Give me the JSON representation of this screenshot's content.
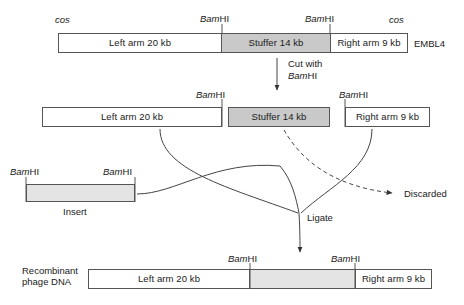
{
  "diagram": {
    "enzyme": {
      "italic_part": "Bam",
      "roman_part": "HI",
      "full": "BamHI"
    },
    "colors": {
      "stuffer_fill": "#c9c9c9",
      "insert_fill": "#e4e4e4",
      "arm_fill": "#ffffff",
      "outline": "#555555",
      "line": "#444444"
    }
  },
  "row_vector": {
    "vector_name": "EMBL4",
    "cos_left": "cos",
    "cos_right": "cos",
    "sites": [
      "BamHI",
      "BamHI"
    ],
    "segments": [
      {
        "label": "Left arm 20 kb",
        "fill": "white"
      },
      {
        "label": "Stuffer 14 kb",
        "fill": "gray"
      },
      {
        "label": "Right arm 9 kb",
        "fill": "white"
      }
    ]
  },
  "step_cut": {
    "line1": "Cut with",
    "line2": "BamHI"
  },
  "row_cut": {
    "sites": [
      "BamHI",
      "BamHI"
    ],
    "segments": [
      {
        "label": "Left arm 20 kb",
        "fill": "white"
      },
      {
        "label": "Stuffer 14 kb",
        "fill": "gray"
      },
      {
        "label": "Right arm 9 kb",
        "fill": "white"
      }
    ]
  },
  "row_insert": {
    "caption": "Insert",
    "sites": [
      "BamHI",
      "BamHI"
    ]
  },
  "step_ligate": {
    "label": "Ligate"
  },
  "discarded": {
    "label": "Discarded"
  },
  "row_product": {
    "caption_line1": "Recombinant",
    "caption_line2": "phage DNA",
    "sites": [
      "BamHI",
      "BamHI"
    ],
    "segments": [
      {
        "label": "Left arm 20 kb",
        "fill": "white"
      },
      {
        "label": "",
        "fill": "light"
      },
      {
        "label": "Right arm 9 kb",
        "fill": "white"
      }
    ]
  }
}
